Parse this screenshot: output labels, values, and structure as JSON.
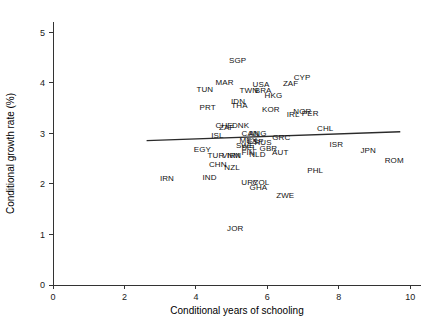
{
  "chart_data": {
    "type": "scatter",
    "title": "",
    "xlabel": "Conditional years of schooling",
    "ylabel": "Conditional growth rate (%)",
    "xlim": [
      0,
      10.3
    ],
    "ylim": [
      0,
      5.2
    ],
    "xticks": [
      0,
      2,
      4,
      6,
      8,
      10
    ],
    "xtick_labels": [
      "0",
      "2",
      "4",
      "6",
      "8",
      "10"
    ],
    "yticks": [
      0,
      1,
      2,
      3,
      4,
      5
    ],
    "ytick_labels": [
      "0",
      "1",
      "2",
      "3",
      "4",
      "5"
    ],
    "grid": false,
    "legend": "none",
    "marker": "text-label",
    "point_label_field": "label",
    "fit_line": {
      "type": "linear",
      "x_start": 2.62,
      "y_start": 2.855,
      "x_end": 9.72,
      "y_end": 3.03,
      "slope": 0.0246,
      "intercept": 2.79
    },
    "points": [
      {
        "label": "SGP",
        "x": 5.17,
        "y": 4.44
      },
      {
        "label": "CYP",
        "x": 6.97,
        "y": 4.11
      },
      {
        "label": "MAR",
        "x": 4.8,
        "y": 4.01
      },
      {
        "label": "ZAF",
        "x": 6.65,
        "y": 3.99
      },
      {
        "label": "USA",
        "x": 5.82,
        "y": 3.97
      },
      {
        "label": "TUN",
        "x": 4.25,
        "y": 3.87
      },
      {
        "label": "TWN",
        "x": 5.48,
        "y": 3.86
      },
      {
        "label": "BRA",
        "x": 5.88,
        "y": 3.85
      },
      {
        "label": "HKG",
        "x": 6.17,
        "y": 3.76
      },
      {
        "label": "IDN",
        "x": 5.18,
        "y": 3.64
      },
      {
        "label": "THA",
        "x": 5.22,
        "y": 3.55
      },
      {
        "label": "PRT",
        "x": 4.33,
        "y": 3.51
      },
      {
        "label": "KOR",
        "x": 6.1,
        "y": 3.47
      },
      {
        "label": "NOR",
        "x": 6.98,
        "y": 3.44
      },
      {
        "label": "PER",
        "x": 7.2,
        "y": 3.4
      },
      {
        "label": "IRL",
        "x": 6.72,
        "y": 3.38
      },
      {
        "label": "CHE",
        "x": 4.79,
        "y": 3.17
      },
      {
        "label": "DNK",
        "x": 5.25,
        "y": 3.17
      },
      {
        "label": "ZAF2",
        "x": 4.86,
        "y": 3.12
      },
      {
        "label": "CHL",
        "x": 7.62,
        "y": 3.1
      },
      {
        "label": "CAN",
        "x": 5.52,
        "y": 3.01
      },
      {
        "label": "ANG",
        "x": 5.73,
        "y": 3.0
      },
      {
        "label": "ISL",
        "x": 4.6,
        "y": 2.97
      },
      {
        "label": "GRC",
        "x": 6.39,
        "y": 2.92
      },
      {
        "label": "MEX",
        "x": 5.47,
        "y": 2.87
      },
      {
        "label": "ESP",
        "x": 5.67,
        "y": 2.85
      },
      {
        "label": "RUS",
        "x": 5.88,
        "y": 2.83
      },
      {
        "label": "ISR",
        "x": 7.93,
        "y": 2.78
      },
      {
        "label": "SWE",
        "x": 5.38,
        "y": 2.76
      },
      {
        "label": "BEL",
        "x": 5.49,
        "y": 2.72
      },
      {
        "label": "GBR",
        "x": 6.03,
        "y": 2.7
      },
      {
        "label": "EGY",
        "x": 4.18,
        "y": 2.69
      },
      {
        "label": "JPN",
        "x": 8.82,
        "y": 2.66
      },
      {
        "label": "FIN",
        "x": 5.46,
        "y": 2.63
      },
      {
        "label": "AUT",
        "x": 6.36,
        "y": 2.62
      },
      {
        "label": "NLD",
        "x": 5.72,
        "y": 2.6
      },
      {
        "label": "TUR",
        "x": 4.56,
        "y": 2.58
      },
      {
        "label": "VNM",
        "x": 4.98,
        "y": 2.57
      },
      {
        "label": "IRN2",
        "x": 5.07,
        "y": 2.57
      },
      {
        "label": "ROM",
        "x": 9.55,
        "y": 2.48
      },
      {
        "label": "CHN",
        "x": 4.61,
        "y": 2.4
      },
      {
        "label": "NZL",
        "x": 5.01,
        "y": 2.34
      },
      {
        "label": "PHL",
        "x": 7.34,
        "y": 2.28
      },
      {
        "label": "IND",
        "x": 4.38,
        "y": 2.13
      },
      {
        "label": "IRN",
        "x": 3.19,
        "y": 2.11
      },
      {
        "label": "URY",
        "x": 5.51,
        "y": 2.04
      },
      {
        "label": "COL",
        "x": 5.82,
        "y": 2.03
      },
      {
        "label": "GHA",
        "x": 5.75,
        "y": 1.94
      },
      {
        "label": "ZWE",
        "x": 6.5,
        "y": 1.78
      },
      {
        "label": "JOR",
        "x": 5.1,
        "y": 1.13
      }
    ]
  },
  "figure": {
    "background_color": "#ffffff",
    "axis_color": "#333333",
    "line_color": "#2b2b2b",
    "label_color": "#111111"
  }
}
